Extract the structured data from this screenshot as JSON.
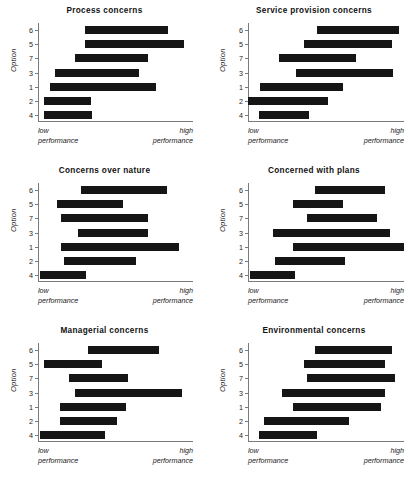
{
  "figure": {
    "background": "#ffffff",
    "bar_color": "#151515",
    "axis_color": "#7b7b7b",
    "y_axis_label": "Option",
    "x_low_label_line1": "low",
    "x_low_label_line2": "performance",
    "x_high_label_line1": "high",
    "x_high_label_line2": "performance",
    "y_tick_labels": [
      "6",
      "5",
      "7",
      "3",
      "1",
      "2",
      "4"
    ]
  },
  "chart_data": [
    {
      "type": "bar",
      "subtype": "horizontal-range-bar",
      "title": "Process concerns",
      "xlabel": "",
      "ylabel": "Option",
      "categories": [
        "6",
        "5",
        "7",
        "3",
        "1",
        "2",
        "4"
      ],
      "xlim": [
        0,
        100
      ],
      "ylim_labels": [
        "low performance",
        "high performance"
      ],
      "grid": false,
      "legend": "none",
      "ranges": [
        {
          "category": "6",
          "start": 30,
          "end": 84
        },
        {
          "category": "5",
          "start": 30,
          "end": 94
        },
        {
          "category": "7",
          "start": 24,
          "end": 71
        },
        {
          "category": "3",
          "start": 11,
          "end": 65
        },
        {
          "category": "1",
          "start": 8,
          "end": 76
        },
        {
          "category": "2",
          "start": 4,
          "end": 34
        },
        {
          "category": "4",
          "start": 4,
          "end": 35
        }
      ]
    },
    {
      "type": "bar",
      "subtype": "horizontal-range-bar",
      "title": "Service provision concerns",
      "xlabel": "",
      "ylabel": "Option",
      "categories": [
        "6",
        "5",
        "7",
        "3",
        "1",
        "2",
        "4"
      ],
      "xlim": [
        0,
        100
      ],
      "ylim_labels": [
        "low performance",
        "high performance"
      ],
      "grid": false,
      "legend": "none",
      "ranges": [
        {
          "category": "6",
          "start": 44,
          "end": 97
        },
        {
          "category": "5",
          "start": 36,
          "end": 92
        },
        {
          "category": "7",
          "start": 20,
          "end": 69
        },
        {
          "category": "3",
          "start": 31,
          "end": 93
        },
        {
          "category": "1",
          "start": 8,
          "end": 61
        },
        {
          "category": "2",
          "start": 0,
          "end": 51
        },
        {
          "category": "4",
          "start": 7,
          "end": 39
        }
      ]
    },
    {
      "type": "bar",
      "subtype": "horizontal-range-bar",
      "title": "Concerns over nature",
      "xlabel": "",
      "ylabel": "Option",
      "categories": [
        "6",
        "5",
        "7",
        "3",
        "1",
        "2",
        "4"
      ],
      "xlim": [
        0,
        100
      ],
      "ylim_labels": [
        "low performance",
        "high performance"
      ],
      "grid": false,
      "legend": "none",
      "ranges": [
        {
          "category": "6",
          "start": 28,
          "end": 83
        },
        {
          "category": "5",
          "start": 12,
          "end": 55
        },
        {
          "category": "7",
          "start": 15,
          "end": 71
        },
        {
          "category": "3",
          "start": 26,
          "end": 71
        },
        {
          "category": "1",
          "start": 15,
          "end": 91
        },
        {
          "category": "2",
          "start": 17,
          "end": 63
        },
        {
          "category": "4",
          "start": 1,
          "end": 31
        }
      ]
    },
    {
      "type": "bar",
      "subtype": "horizontal-range-bar",
      "title": "Concerned with plans",
      "xlabel": "",
      "ylabel": "Option",
      "categories": [
        "6",
        "5",
        "7",
        "3",
        "1",
        "2",
        "4"
      ],
      "xlim": [
        0,
        100
      ],
      "ylim_labels": [
        "low performance",
        "high performance"
      ],
      "grid": false,
      "legend": "none",
      "ranges": [
        {
          "category": "6",
          "start": 43,
          "end": 88
        },
        {
          "category": "5",
          "start": 29,
          "end": 61
        },
        {
          "category": "7",
          "start": 38,
          "end": 83
        },
        {
          "category": "3",
          "start": 16,
          "end": 91
        },
        {
          "category": "1",
          "start": 29,
          "end": 100
        },
        {
          "category": "2",
          "start": 17,
          "end": 62
        },
        {
          "category": "4",
          "start": 1,
          "end": 30
        }
      ]
    },
    {
      "type": "bar",
      "subtype": "horizontal-range-bar",
      "title": "Managerial concerns",
      "xlabel": "",
      "ylabel": "Option",
      "categories": [
        "6",
        "5",
        "7",
        "3",
        "1",
        "2",
        "4"
      ],
      "xlim": [
        0,
        100
      ],
      "ylim_labels": [
        "low performance",
        "high performance"
      ],
      "grid": false,
      "legend": "none",
      "ranges": [
        {
          "category": "6",
          "start": 32,
          "end": 78
        },
        {
          "category": "5",
          "start": 4,
          "end": 41
        },
        {
          "category": "7",
          "start": 20,
          "end": 58
        },
        {
          "category": "3",
          "start": 24,
          "end": 93
        },
        {
          "category": "1",
          "start": 14,
          "end": 57
        },
        {
          "category": "2",
          "start": 14,
          "end": 51
        },
        {
          "category": "4",
          "start": 1,
          "end": 43
        }
      ]
    },
    {
      "type": "bar",
      "subtype": "horizontal-range-bar",
      "title": "Environmental concerns",
      "xlabel": "",
      "ylabel": "Option",
      "categories": [
        "6",
        "5",
        "7",
        "3",
        "1",
        "2",
        "4"
      ],
      "xlim": [
        0,
        100
      ],
      "ylim_labels": [
        "low performance",
        "high performance"
      ],
      "grid": false,
      "legend": "none",
      "ranges": [
        {
          "category": "6",
          "start": 43,
          "end": 92
        },
        {
          "category": "5",
          "start": 36,
          "end": 88
        },
        {
          "category": "7",
          "start": 38,
          "end": 94
        },
        {
          "category": "3",
          "start": 22,
          "end": 88
        },
        {
          "category": "1",
          "start": 29,
          "end": 85
        },
        {
          "category": "2",
          "start": 10,
          "end": 65
        },
        {
          "category": "4",
          "start": 7,
          "end": 44
        }
      ]
    }
  ]
}
